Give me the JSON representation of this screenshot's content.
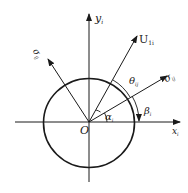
{
  "diagram": {
    "origin_label": "O",
    "x_axis_label": "x",
    "x_axis_sub": "i",
    "y_axis_label": "y",
    "y_axis_sub": "i",
    "vector_u_label": "U",
    "vector_u_sub": "1i",
    "sigma_right_label": "σ",
    "sigma_right_sub": "ij",
    "sigma_left_label": "σ",
    "sigma_left_sub": "ij",
    "theta_label": "θ",
    "theta_sub": "ij",
    "alpha_label": "α",
    "alpha_sub": "i",
    "beta_label": "β",
    "beta_sub": "i",
    "colors": {
      "stroke": "#1a1a1a",
      "background": "#ffffff"
    }
  }
}
